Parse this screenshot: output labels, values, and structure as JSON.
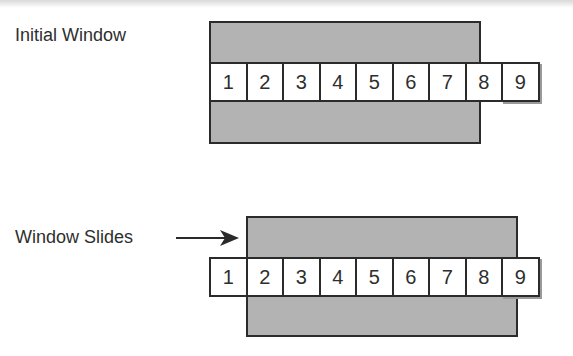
{
  "diagrams": [
    {
      "label": "Initial Window",
      "cells": [
        "1",
        "2",
        "3",
        "4",
        "5",
        "6",
        "7",
        "8",
        "9"
      ],
      "window_range": [
        1,
        7
      ]
    },
    {
      "label": "Window Slides",
      "cells": [
        "1",
        "2",
        "3",
        "4",
        "5",
        "6",
        "7",
        "8",
        "9"
      ],
      "window_range": [
        2,
        8
      ],
      "arrow": "right-arrow"
    }
  ],
  "colors": {
    "window_fill": "#b3b3b3",
    "border": "#2b2b2b",
    "cell_fill": "#ffffff"
  }
}
